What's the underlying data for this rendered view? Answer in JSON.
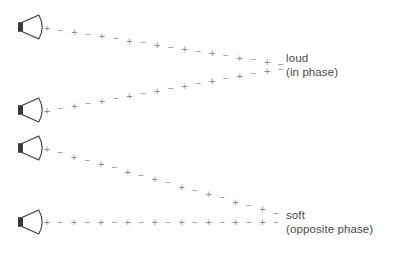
{
  "figure": {
    "background": "#ffffff",
    "width": 396,
    "height": 258,
    "stroke_color": "#8c8c99",
    "speaker_color": "#3a3a3a",
    "text_color": "#4a4a4a"
  },
  "symbols": {
    "plus": "+",
    "minus": "−"
  },
  "speakers": [
    {
      "name": "speaker-top",
      "x": 18,
      "y": 27,
      "width": 26,
      "height": 24
    },
    {
      "name": "speaker-upper-middle",
      "x": 18,
      "y": 110,
      "width": 26,
      "height": 24
    },
    {
      "name": "speaker-lower-middle",
      "x": 18,
      "y": 148,
      "width": 26,
      "height": 24
    },
    {
      "name": "speaker-bottom",
      "x": 18,
      "y": 222,
      "width": 26,
      "height": 24
    }
  ],
  "waves": [
    {
      "name": "wave-from-top-speaker",
      "start": {
        "x": 47,
        "y": 28
      },
      "end": {
        "x": 281,
        "y": 64
      },
      "marks": 18,
      "start_symbol": "+"
    },
    {
      "name": "wave-from-upper-middle-speaker",
      "start": {
        "x": 47,
        "y": 111
      },
      "end": {
        "x": 281,
        "y": 69
      },
      "marks": 18,
      "start_symbol": "+"
    },
    {
      "name": "wave-from-lower-middle-speaker",
      "start": {
        "x": 47,
        "y": 149
      },
      "end": {
        "x": 276,
        "y": 213
      },
      "marks": 18,
      "start_symbol": "+"
    },
    {
      "name": "wave-from-bottom-speaker",
      "start": {
        "x": 47,
        "y": 222
      },
      "end": {
        "x": 276,
        "y": 222
      },
      "marks": 18,
      "start_symbol": "+"
    }
  ],
  "labels": {
    "loud": {
      "title": "loud",
      "subtitle": "(in phase)"
    },
    "soft": {
      "title": "soft",
      "subtitle": "(opposite phase)"
    }
  }
}
